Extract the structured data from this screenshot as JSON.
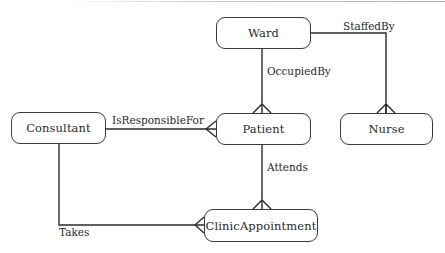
{
  "diagram": {
    "type": "entity-relationship",
    "entities": [
      {
        "id": "ward",
        "label": "Ward"
      },
      {
        "id": "nurse",
        "label": "Nurse"
      },
      {
        "id": "consultant",
        "label": "Consultant"
      },
      {
        "id": "patient",
        "label": "Patient"
      },
      {
        "id": "clinic_appointment",
        "label": "ClinicAppointment"
      }
    ],
    "relationships": [
      {
        "label": "StaffedBy",
        "from": "Ward",
        "to": "Nurse",
        "cardinality": "one-to-many"
      },
      {
        "label": "OccupiedBy",
        "from": "Ward",
        "to": "Patient",
        "cardinality": "one-to-many"
      },
      {
        "label": "IsResponsibleFor",
        "from": "Consultant",
        "to": "Patient",
        "cardinality": "one-to-many"
      },
      {
        "label": "Attends",
        "from": "Patient",
        "to": "ClinicAppointment",
        "cardinality": "one-to-many"
      },
      {
        "label": "Takes",
        "from": "Consultant",
        "to": "ClinicAppointment",
        "cardinality": "one-to-many"
      }
    ],
    "colors": {
      "line": "#2a2a2a",
      "border": "#3a3a3a",
      "background": "#ffffff"
    }
  }
}
